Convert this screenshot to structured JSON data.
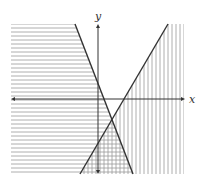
{
  "diagram": {
    "axes": {
      "x_label": "x",
      "y_label": "y",
      "origin_px": [
        98,
        99
      ],
      "x_range_px": [
        11,
        184
      ],
      "y_range_px": [
        24,
        174
      ]
    },
    "lines": [
      {
        "name": "decreasing-boundary-line",
        "from_px": [
          75,
          24
        ],
        "to_px": [
          133,
          174
        ],
        "style": "solid"
      },
      {
        "name": "increasing-boundary-line",
        "from_px": [
          168,
          24
        ],
        "to_px": [
          80,
          174
        ],
        "style": "solid"
      }
    ],
    "intersection_px": [
      112,
      122
    ],
    "shading": [
      {
        "name": "horizontal-hatch-region",
        "direction": "horizontal",
        "side": "left of decreasing line",
        "spacing_px": 4
      },
      {
        "name": "vertical-hatch-region",
        "direction": "vertical",
        "side": "right of increasing line",
        "spacing_px": 4
      }
    ],
    "colors": {
      "line": "#333333",
      "hatch": "#9a9a9a",
      "axis": "#333333",
      "background": "#ffffff"
    }
  }
}
